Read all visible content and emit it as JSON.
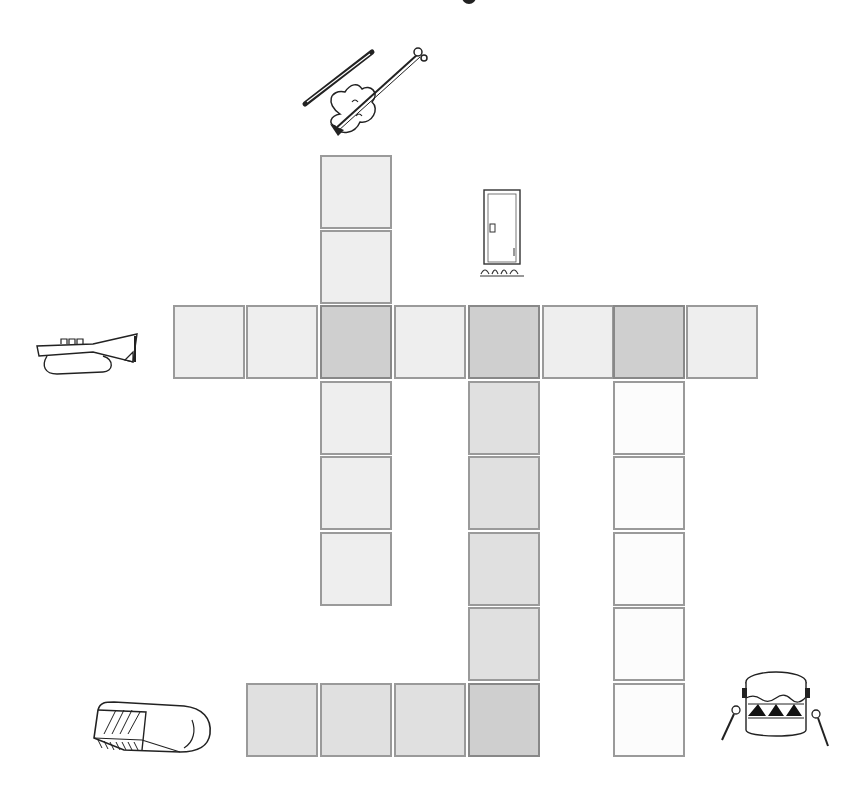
{
  "puzzle": {
    "type": "picture crossword",
    "cell_size": 74,
    "colors": {
      "light_cell": "#eeeeee",
      "mid_cell": "#e0e0e0",
      "intersection_cell": "#cfcfcf",
      "white_cell": "#fcfcfc",
      "border": "#9a9a9a"
    },
    "clues": [
      {
        "id": "violin",
        "picture": "violin-with-bow",
        "direction": "down",
        "length": 6
      },
      {
        "id": "trumpet",
        "picture": "trumpet",
        "direction": "across",
        "length": 8
      },
      {
        "id": "door",
        "picture": "door",
        "direction": "down",
        "length": 6
      },
      {
        "id": "drum",
        "picture": "drum-with-sticks",
        "direction": "down",
        "length": 6
      },
      {
        "id": "eraser",
        "picture": "eraser",
        "direction": "across",
        "length": 4
      }
    ],
    "cells": [
      {
        "x": 320,
        "y": 155,
        "shade": "light",
        "word": "violin"
      },
      {
        "x": 320,
        "y": 230,
        "shade": "light",
        "word": "violin"
      },
      {
        "x": 173,
        "y": 305,
        "shade": "light",
        "word": "trumpet"
      },
      {
        "x": 246,
        "y": 305,
        "shade": "light",
        "word": "trumpet"
      },
      {
        "x": 320,
        "y": 305,
        "shade": "dark",
        "word": "violin,trumpet"
      },
      {
        "x": 394,
        "y": 305,
        "shade": "light",
        "word": "trumpet"
      },
      {
        "x": 468,
        "y": 305,
        "shade": "dark",
        "word": "trumpet,door"
      },
      {
        "x": 542,
        "y": 305,
        "shade": "light",
        "word": "trumpet"
      },
      {
        "x": 613,
        "y": 305,
        "shade": "dark",
        "word": "trumpet,drum"
      },
      {
        "x": 686,
        "y": 305,
        "shade": "light",
        "word": "trumpet"
      },
      {
        "x": 320,
        "y": 381,
        "shade": "light",
        "word": "violin"
      },
      {
        "x": 320,
        "y": 456,
        "shade": "light",
        "word": "violin"
      },
      {
        "x": 320,
        "y": 532,
        "shade": "light",
        "word": "violin"
      },
      {
        "x": 468,
        "y": 381,
        "shade": "mid",
        "word": "door"
      },
      {
        "x": 468,
        "y": 456,
        "shade": "mid",
        "word": "door"
      },
      {
        "x": 468,
        "y": 532,
        "shade": "mid",
        "word": "door"
      },
      {
        "x": 468,
        "y": 607,
        "shade": "mid",
        "word": "door"
      },
      {
        "x": 468,
        "y": 683,
        "shade": "dark",
        "word": "door,eraser"
      },
      {
        "x": 613,
        "y": 381,
        "shade": "white",
        "word": "drum"
      },
      {
        "x": 613,
        "y": 456,
        "shade": "white",
        "word": "drum"
      },
      {
        "x": 613,
        "y": 532,
        "shade": "white",
        "word": "drum"
      },
      {
        "x": 613,
        "y": 607,
        "shade": "white",
        "word": "drum"
      },
      {
        "x": 613,
        "y": 683,
        "shade": "white",
        "word": "drum"
      },
      {
        "x": 246,
        "y": 683,
        "shade": "mid",
        "word": "eraser"
      },
      {
        "x": 320,
        "y": 683,
        "shade": "mid",
        "word": "eraser"
      },
      {
        "x": 394,
        "y": 683,
        "shade": "mid",
        "word": "eraser"
      }
    ]
  }
}
